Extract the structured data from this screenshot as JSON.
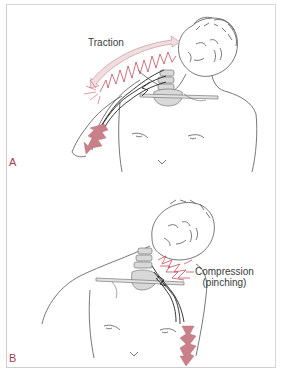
{
  "figure": {
    "panels": [
      {
        "letter": "A",
        "label": "Traction",
        "mechanism": "traction",
        "arrow_icon": "double-headed-arrow-icon",
        "pain_icon": "lightning-bolt-icon"
      },
      {
        "letter": "B",
        "label_line1": "Compression",
        "label_line2": "(pinching)",
        "mechanism": "compression",
        "pain_icon": "lightning-bolt-icon"
      }
    ],
    "colors": {
      "accent_red": "#c0505f",
      "bolt_fill": "#c98088",
      "arrow_fill": "#f1dde0",
      "arrow_stroke": "#c9a3a8",
      "spine_gray": "#d5d5d5",
      "line": "#555555",
      "frame": "#d8d8d8"
    }
  }
}
